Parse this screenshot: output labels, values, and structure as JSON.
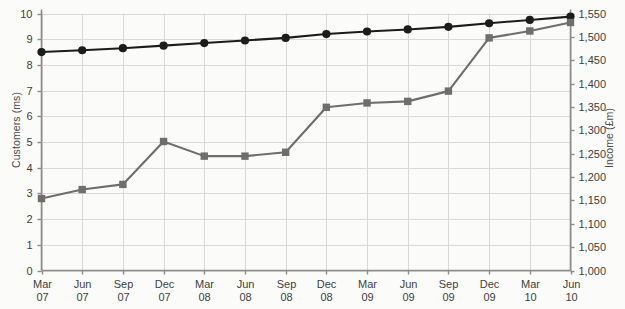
{
  "chart_data": {
    "type": "line",
    "title": "",
    "subtitle": "",
    "xlabel": "",
    "grid": true,
    "legend": "none",
    "categories": [
      "Mar 07",
      "Jun 07",
      "Sep 07",
      "Dec 07",
      "Mar 08",
      "Jun 08",
      "Sep 08",
      "Dec 08",
      "Mar 09",
      "Jun 09",
      "Sep 09",
      "Dec 09",
      "Mar 10",
      "Jun 10"
    ],
    "category_lines": [
      [
        "Mar",
        "07"
      ],
      [
        "Jun",
        "07"
      ],
      [
        "Sep",
        "07"
      ],
      [
        "Dec",
        "07"
      ],
      [
        "Mar",
        "08"
      ],
      [
        "Jun",
        "08"
      ],
      [
        "Sep",
        "08"
      ],
      [
        "Dec",
        "08"
      ],
      [
        "Mar",
        "09"
      ],
      [
        "Jun",
        "09"
      ],
      [
        "Sep",
        "09"
      ],
      [
        "Dec",
        "09"
      ],
      [
        "Mar",
        "10"
      ],
      [
        "Jun",
        "10"
      ]
    ],
    "axes": {
      "left": {
        "label": "Customers (ms)",
        "min": 0,
        "max": 10,
        "step": 1,
        "ticks": [
          "0",
          "1",
          "2",
          "3",
          "4",
          "5",
          "6",
          "7",
          "8",
          "9",
          "10"
        ]
      },
      "right": {
        "label": "Income (£m)",
        "min": 1000,
        "max": 1550,
        "step": 50,
        "ticks": [
          "1,000",
          "1,050",
          "1,100",
          "1,150",
          "1,200",
          "1,250",
          "1,300",
          "1,350",
          "1,400",
          "1,450",
          "1,500",
          "1,550"
        ]
      }
    },
    "series": [
      {
        "name": "Customers (ms)",
        "axis": "left",
        "marker": "circle",
        "color": "#1c1c1c",
        "values": [
          8.5,
          8.57,
          8.65,
          8.75,
          8.85,
          8.95,
          9.05,
          9.2,
          9.3,
          9.38,
          9.48,
          9.62,
          9.75,
          9.88
        ]
      },
      {
        "name": "Income (£m)",
        "axis": "right",
        "marker": "square",
        "color": "#6e6e6e",
        "values_left_scale": [
          2.8,
          3.15,
          3.35,
          5.02,
          4.45,
          4.45,
          4.6,
          6.35,
          6.52,
          6.58,
          6.98,
          9.05,
          9.32,
          9.65
        ],
        "values": [
          1140,
          1158,
          1168,
          1251,
          1222,
          1222,
          1230,
          1318,
          1326,
          1329,
          1349,
          1452,
          1466,
          1483
        ]
      }
    ]
  },
  "colors": {
    "series_customers": "#1c1c1c",
    "series_income": "#6e6e6e",
    "grid": "#d9d9d9",
    "axis": "#8c8c8c",
    "background": "#fbfbfa",
    "text": "#3f3f3f"
  }
}
